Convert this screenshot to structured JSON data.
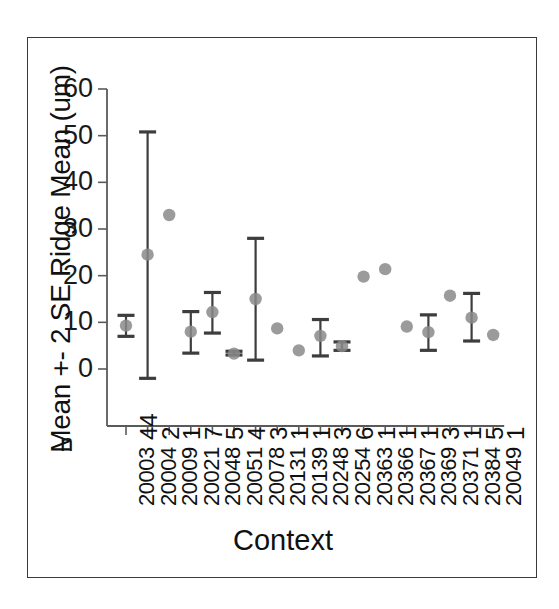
{
  "chart_data": {
    "type": "scatter",
    "title": "",
    "xlabel": "Context",
    "ylabel": "Mean +- 2 SE Ridge Mean (um)",
    "ylim": [
      -12,
      60
    ],
    "yticks": [
      0,
      10,
      20,
      30,
      40,
      50,
      60
    ],
    "grid": false,
    "legend": "none",
    "n_axis_label": "n",
    "categories": [
      "20003",
      "20004",
      "20009",
      "20021",
      "20048",
      "20051",
      "20078",
      "20131",
      "20139",
      "20248",
      "20254",
      "20363",
      "20366",
      "20367",
      "20369",
      "20371",
      "20384",
      "20049"
    ],
    "n_values": [
      44,
      2,
      1,
      7,
      5,
      4,
      3,
      1,
      1,
      3,
      6,
      1,
      1,
      1,
      3,
      1,
      5,
      1
    ],
    "series": [
      {
        "name": "Mean Ridge Mean",
        "values": [
          9.3,
          24.5,
          33.0,
          8.0,
          12.2,
          3.3,
          15.0,
          8.7,
          4.0,
          7.1,
          4.9,
          19.8,
          21.4,
          9.1,
          7.9,
          15.7,
          11.0,
          7.3
        ]
      },
      {
        "name": "Upper (mean + 2 SE)",
        "values": [
          11.5,
          50.8,
          null,
          12.3,
          16.4,
          3.8,
          28.0,
          null,
          null,
          10.6,
          5.8,
          null,
          null,
          null,
          11.6,
          null,
          16.2,
          null
        ]
      },
      {
        "name": "Lower (mean - 2 SE)",
        "values": [
          7.0,
          -2.0,
          null,
          3.4,
          7.7,
          3.0,
          1.9,
          null,
          null,
          2.8,
          4.0,
          null,
          null,
          null,
          4.0,
          null,
          6.0,
          null
        ]
      }
    ]
  },
  "style": {
    "point_color": "#8a8a8a",
    "bar_color": "#3d3d3d",
    "axis_color": "#5a5a5a",
    "frame_color": "#3a3a3a",
    "text_color": "#111111"
  }
}
